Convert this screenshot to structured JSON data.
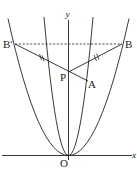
{
  "diagram": {
    "type": "coordinate-geometry",
    "axes": {
      "x_label": "x",
      "y_label": "y",
      "origin_label": "O"
    },
    "points": {
      "B_prime": {
        "label": "B'",
        "x": 15,
        "y": 44
      },
      "B": {
        "label": "B",
        "x": 122,
        "y": 44
      },
      "P": {
        "label": "P",
        "x": 68,
        "y": 72
      },
      "A": {
        "label": "A",
        "x": 88,
        "y": 81
      },
      "O": {
        "label": "O",
        "x": 68,
        "y": 156
      }
    },
    "curves": [
      {
        "name": "outer-parabola",
        "through": [
          "B'",
          "O",
          "B"
        ]
      },
      {
        "name": "inner-parabola",
        "through": [
          "O"
        ]
      }
    ],
    "segments": [
      {
        "from": "B'",
        "to": "B",
        "style": "dashed"
      },
      {
        "from": "B'",
        "to": "A",
        "style": "solid",
        "marks": "double-tick"
      },
      {
        "from": "P",
        "to": "B",
        "style": "solid",
        "marks": "double-tick"
      }
    ],
    "colors": {
      "stroke": "#222222",
      "background": "#ffffff"
    }
  }
}
